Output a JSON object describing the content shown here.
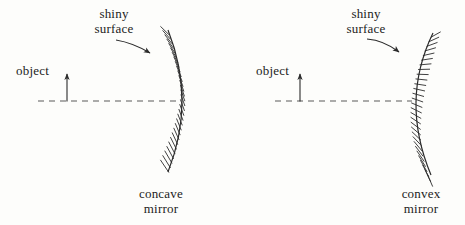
{
  "figure": {
    "background_color": "#fdfdfb",
    "ink_color": "#2b2b2b",
    "dash_color": "#5a5a5a"
  },
  "diagrams": [
    {
      "id": "concave",
      "object_label": "object",
      "surface_label_line1": "shiny",
      "surface_label_line2": "surface",
      "caption_line1": "concave",
      "caption_line2": "mirror",
      "axis": {
        "x1": 38,
        "x2": 180,
        "y": 101
      },
      "object_arrow": {
        "x": 67,
        "y_base": 101,
        "y_tip": 73
      },
      "mirror": {
        "vertex_x": 178,
        "top_x": 168,
        "top_y": 30,
        "bottom_x": 168,
        "bottom_y": 172,
        "bulge": "right",
        "hatch_side": "right",
        "hatch_count": 30
      },
      "pointer_arrow": {
        "from_x": 114,
        "from_y": 40,
        "to_x": 152,
        "to_y": 52
      }
    },
    {
      "id": "convex",
      "object_label": "object",
      "surface_label_line1": "shiny",
      "surface_label_line2": "surface",
      "caption_line1": "convex",
      "caption_line2": "mirror",
      "axis": {
        "x1": 275,
        "x2": 412,
        "y": 101
      },
      "object_arrow": {
        "x": 300,
        "y_base": 101,
        "y_tip": 73
      },
      "mirror": {
        "vertex_x": 410,
        "top_x": 433,
        "top_y": 33,
        "bottom_x": 431,
        "bottom_y": 175,
        "bulge": "left",
        "hatch_side": "right",
        "hatch_count": 30
      },
      "pointer_arrow": {
        "from_x": 367,
        "from_y": 40,
        "to_x": 400,
        "to_y": 52
      }
    }
  ],
  "labels": {
    "concave_object": {
      "text": "object",
      "x": 16,
      "y": 71
    },
    "concave_shiny": {
      "x": 84,
      "y": 14
    },
    "concave_caption": {
      "x": 130,
      "y": 190
    },
    "convex_object": {
      "text": "object",
      "x": 256,
      "y": 71
    },
    "convex_shiny": {
      "x": 340,
      "y": 14
    },
    "convex_caption": {
      "x": 392,
      "y": 190
    }
  }
}
